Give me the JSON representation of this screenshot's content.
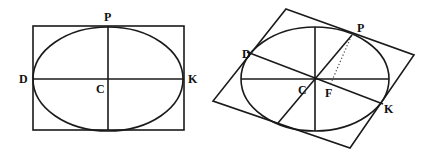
{
  "figures": [
    {
      "id": "left",
      "description": "Ellipse inscribed in rectangle with principal axes",
      "frame": {
        "type": "rectangle",
        "x1": 33,
        "y1": 26,
        "x2": 184,
        "y2": 130
      },
      "ellipse": {
        "cx": 108,
        "cy": 79,
        "rx": 75,
        "ry": 52,
        "rotation": 0
      },
      "lines": [
        {
          "name": "major-axis",
          "from": [
            33,
            79
          ],
          "to": [
            184,
            79
          ]
        },
        {
          "name": "minor-axis",
          "from": [
            108,
            26
          ],
          "to": [
            108,
            130
          ]
        }
      ],
      "labels": [
        {
          "text": "P",
          "x": 104,
          "y": 21
        },
        {
          "text": "D",
          "x": 19,
          "y": 82
        },
        {
          "text": "K",
          "x": 188,
          "y": 82
        },
        {
          "text": "C",
          "x": 96,
          "y": 93
        }
      ]
    },
    {
      "id": "right",
      "description": "Ellipse inscribed in parallelogram with conjugate diameters",
      "frame": {
        "type": "parallelogram",
        "points": [
          [
            286,
            9
          ],
          [
            414,
            55
          ],
          [
            350,
            148
          ],
          [
            213,
            101
          ]
        ]
      },
      "ellipse": {
        "cx": 315,
        "cy": 79,
        "rx": 74,
        "ry": 52,
        "rotation": 0
      },
      "lines": [
        {
          "name": "major-axis",
          "from": [
            241,
            79
          ],
          "to": [
            389,
            79
          ]
        },
        {
          "name": "minor-axis",
          "from": [
            315,
            27
          ],
          "to": [
            315,
            131
          ]
        },
        {
          "name": "diameter-PC",
          "from": [
            352,
            35
          ],
          "to": [
            278,
            123
          ]
        },
        {
          "name": "diameter-DK",
          "from": [
            247,
            52
          ],
          "to": [
            383,
            104
          ]
        }
      ],
      "dotted_lines": [
        {
          "name": "perpendicular-PF",
          "from": [
            350,
            38
          ],
          "to": [
            331,
            83
          ]
        }
      ],
      "labels": [
        {
          "text": "P",
          "x": 357,
          "y": 32
        },
        {
          "text": "D",
          "x": 242,
          "y": 57
        },
        {
          "text": "K",
          "x": 384,
          "y": 113
        },
        {
          "text": "C",
          "x": 298,
          "y": 93
        },
        {
          "text": "F",
          "x": 326,
          "y": 96
        }
      ]
    }
  ],
  "background_text": [
    {
      "text": "…",
      "x": 0,
      "y": 0
    }
  ],
  "colors": {
    "stroke": "#1a1a1a",
    "background": "#ffffff",
    "label": "#111111"
  }
}
